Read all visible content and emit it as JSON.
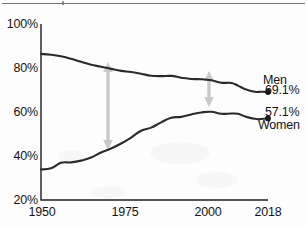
{
  "chart_data": {
    "type": "line",
    "title": "",
    "subtitle": "",
    "xlabel": "",
    "ylabel": "",
    "xlim": [
      1950,
      2018
    ],
    "ylim": [
      20,
      100
    ],
    "grid": false,
    "legend_position": "inline-right",
    "y_ticks": [
      "20%",
      "40%",
      "60%",
      "80%",
      "100%"
    ],
    "y_tick_values": [
      20,
      40,
      60,
      80,
      100
    ],
    "x_ticks": [
      "1950",
      "1975",
      "2000",
      "2018"
    ],
    "x_tick_values": [
      1950,
      1975,
      2000,
      2018
    ],
    "series": [
      {
        "name": "Men",
        "end_label": "69.1%",
        "end_value": 69.1,
        "color": "#2b2b2b",
        "x": [
          1950,
          1953,
          1956,
          1959,
          1962,
          1965,
          1968,
          1971,
          1974,
          1977,
          1980,
          1983,
          1986,
          1989,
          1992,
          1995,
          1998,
          2001,
          2004,
          2007,
          2009,
          2011,
          2014,
          2016,
          2018
        ],
        "values": [
          86.4,
          86.0,
          85.3,
          84.2,
          82.8,
          81.5,
          80.6,
          79.6,
          78.7,
          78.2,
          77.4,
          76.5,
          76.3,
          76.4,
          75.6,
          75.0,
          74.9,
          74.4,
          73.3,
          73.2,
          72.0,
          70.5,
          69.2,
          69.2,
          69.1
        ]
      },
      {
        "name": "Women",
        "end_label": "57.1%",
        "end_value": 57.1,
        "color": "#2b2b2b",
        "x": [
          1950,
          1953,
          1956,
          1959,
          1962,
          1965,
          1968,
          1971,
          1974,
          1977,
          1980,
          1983,
          1986,
          1989,
          1992,
          1995,
          1998,
          2001,
          2004,
          2007,
          2009,
          2011,
          2014,
          2016,
          2018
        ],
        "values": [
          33.9,
          34.4,
          36.9,
          37.1,
          37.9,
          39.3,
          41.6,
          43.4,
          45.7,
          48.4,
          51.5,
          52.9,
          55.3,
          57.4,
          57.8,
          58.9,
          59.8,
          60.1,
          59.2,
          59.3,
          59.2,
          58.1,
          56.9,
          56.8,
          57.1
        ]
      }
    ],
    "annotations": [
      {
        "name": "gap-arrow-1970",
        "type": "double-headed-vertical-arrow",
        "x": 1970,
        "y_top": 79.6,
        "y_bottom": 43.5,
        "color": "#c9c9c9"
      },
      {
        "name": "gap-arrow-2000",
        "type": "double-headed-vertical-arrow",
        "x": 2000,
        "y_top": 74.8,
        "y_bottom": 60.4,
        "color": "#c9c9c9"
      }
    ]
  }
}
